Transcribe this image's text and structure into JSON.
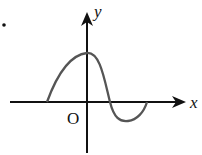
{
  "diagram": {
    "type": "function-graph",
    "axes": {
      "x_label": "x",
      "y_label": "y",
      "origin_label": "O"
    },
    "curve": {
      "description": "wave-like curve: rises from x-axis left of origin, peaks on y-axis, crosses x-axis right of origin, dips below, returns to x-axis",
      "points": [
        [
          47,
          102
        ],
        [
          60,
          72
        ],
        [
          75,
          55
        ],
        [
          87,
          53
        ],
        [
          97,
          60
        ],
        [
          110,
          102
        ],
        [
          118,
          118
        ],
        [
          128,
          121
        ],
        [
          140,
          115
        ],
        [
          147,
          102
        ]
      ]
    },
    "colors": {
      "axis": "#111111",
      "curve": "#555555",
      "background": "#ffffff"
    }
  }
}
